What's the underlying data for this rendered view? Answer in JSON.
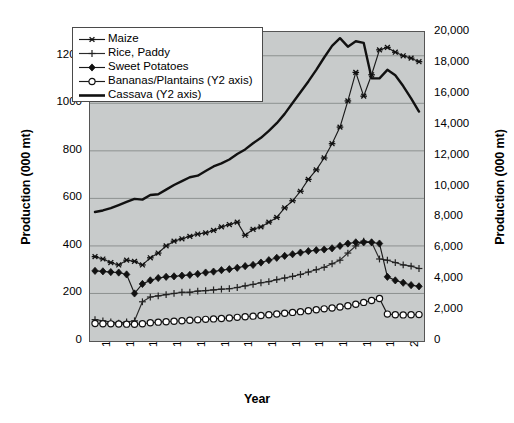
{
  "chart_data": {
    "type": "line",
    "title": "",
    "xlabel": "Year",
    "ylabel": "Production (000 mt)",
    "y2label": "Production (000 mt)",
    "grid": true,
    "legend_position": "top-left",
    "x": [
      1961,
      1962,
      1963,
      1964,
      1965,
      1966,
      1967,
      1968,
      1969,
      1970,
      1971,
      1972,
      1973,
      1974,
      1975,
      1976,
      1977,
      1978,
      1979,
      1980,
      1981,
      1982,
      1983,
      1984,
      1985,
      1986,
      1987,
      1988,
      1989,
      1990,
      1991,
      1992,
      1993,
      1994,
      1995,
      1996,
      1997,
      1998,
      1999,
      2000,
      2001,
      2002
    ],
    "xtick_labels": [
      "1961",
      "1964",
      "1967",
      "1970",
      "1973",
      "1976",
      "1979",
      "1982",
      "1985",
      "1988",
      "1991",
      "1994",
      "1997",
      "2000"
    ],
    "xlim": [
      1961,
      2002
    ],
    "ylim": [
      0,
      1300
    ],
    "ytick_labels": [
      "0",
      "200",
      "400",
      "600",
      "800",
      "1000",
      "1200"
    ],
    "ytick_values": [
      0,
      200,
      400,
      600,
      800,
      1000,
      1200
    ],
    "y2lim": [
      0,
      20000
    ],
    "y2tick_labels": [
      "0",
      "2,000",
      "4,000",
      "6,000",
      "8,000",
      "10,000",
      "12,000",
      "14,000",
      "16,000",
      "18,000",
      "20,000"
    ],
    "y2tick_values": [
      0,
      2000,
      4000,
      6000,
      8000,
      10000,
      12000,
      14000,
      16000,
      18000,
      20000
    ],
    "series": [
      {
        "name": "Maize",
        "axis": "y1",
        "marker": "star",
        "color": "#1a1a1a",
        "values": [
          355,
          345,
          330,
          320,
          340,
          335,
          320,
          350,
          370,
          400,
          420,
          430,
          440,
          450,
          455,
          465,
          480,
          490,
          500,
          445,
          470,
          480,
          500,
          520,
          560,
          590,
          630,
          680,
          720,
          770,
          830,
          900,
          1010,
          1130,
          1030,
          1120,
          1225,
          1235,
          1215,
          1200,
          1190,
          1175
        ]
      },
      {
        "name": "Rice, Paddy",
        "axis": "y1",
        "marker": "plus",
        "color": "#2b2b2b",
        "values": [
          90,
          85,
          80,
          75,
          80,
          85,
          165,
          185,
          190,
          195,
          200,
          205,
          205,
          210,
          212,
          215,
          218,
          220,
          225,
          232,
          238,
          245,
          250,
          258,
          265,
          272,
          280,
          290,
          300,
          310,
          325,
          340,
          370,
          400,
          420,
          415,
          345,
          340,
          330,
          320,
          315,
          305
        ]
      },
      {
        "name": "Sweet Potatoes",
        "axis": "y1",
        "marker": "diamond",
        "color": "#1a1a1a",
        "values": [
          295,
          293,
          290,
          288,
          280,
          200,
          240,
          255,
          265,
          270,
          272,
          275,
          278,
          282,
          288,
          292,
          298,
          302,
          308,
          315,
          320,
          330,
          340,
          350,
          358,
          365,
          372,
          378,
          382,
          385,
          390,
          400,
          410,
          415,
          415,
          415,
          410,
          270,
          255,
          245,
          235,
          230
        ]
      },
      {
        "name": "Bananas/Plantains (Y2 axis)",
        "axis": "y2",
        "marker": "circle",
        "color": "#1a1a1a",
        "values": [
          1130,
          1120,
          1110,
          1100,
          1090,
          1080,
          1120,
          1180,
          1220,
          1250,
          1280,
          1310,
          1340,
          1370,
          1400,
          1430,
          1460,
          1490,
          1530,
          1570,
          1610,
          1650,
          1700,
          1750,
          1800,
          1850,
          1900,
          1960,
          2020,
          2080,
          2140,
          2200,
          2280,
          2380,
          2500,
          2620,
          2750,
          1740,
          1700,
          1690,
          1700,
          1710
        ]
      },
      {
        "name": "Cassava (Y2 axis)",
        "axis": "y2",
        "marker": "none",
        "color": "#111111",
        "values": [
          8350,
          8450,
          8600,
          8800,
          9000,
          9200,
          9150,
          9450,
          9500,
          9800,
          10100,
          10350,
          10600,
          10700,
          11000,
          11300,
          11500,
          11750,
          12100,
          12400,
          12800,
          13150,
          13600,
          14100,
          14700,
          15400,
          16100,
          16800,
          17550,
          18350,
          19100,
          19600,
          19050,
          19400,
          19300,
          17000,
          17000,
          17550,
          17200,
          16500,
          15700,
          14850
        ]
      }
    ]
  }
}
